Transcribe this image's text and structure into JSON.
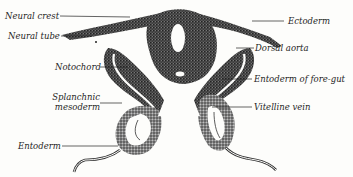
{
  "figure": {
    "labels_left": [
      {
        "id": "neural-crest",
        "text": "Neural crest"
      },
      {
        "id": "neural-tube",
        "text": "Neural tube"
      },
      {
        "id": "notochord",
        "text": "Notochord"
      },
      {
        "id": "splanchnic-mesoderm",
        "text": "Splanchnic mesoderm",
        "line1": "Splanchnic",
        "line2": "mesoderm"
      },
      {
        "id": "entoderm",
        "text": "Entoderm"
      }
    ],
    "labels_right": [
      {
        "id": "ectoderm",
        "text": "Ectoderm"
      },
      {
        "id": "dorsal-aorta",
        "text": "Dorsal aorta"
      },
      {
        "id": "entoderm-fore-gut",
        "text": "Entoderm of fore-gut"
      },
      {
        "id": "vitelline-vein",
        "text": "Vitelline vein"
      }
    ],
    "colors": {
      "ink": "#1f1f1f",
      "tissue": "#3a3a3a",
      "background": "#fdfdfb"
    }
  }
}
